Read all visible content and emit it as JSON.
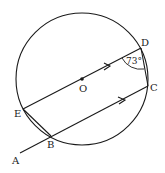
{
  "diagram": {
    "type": "circle-geometry",
    "circle": {
      "center_label": "O",
      "cx": 82,
      "cy": 79,
      "r": 66
    },
    "points": {
      "A": {
        "label": "A",
        "x": 20,
        "y": 153
      },
      "B": {
        "label": "B",
        "x": 51,
        "y": 136
      },
      "C": {
        "label": "C",
        "x": 148,
        "y": 86
      },
      "D": {
        "label": "D",
        "x": 141,
        "y": 48
      },
      "E": {
        "label": "E",
        "x": 23,
        "y": 109
      },
      "O": {
        "label": "O",
        "x": 82,
        "y": 79
      }
    },
    "segments": [
      "ED",
      "AC",
      "EB",
      "DC"
    ],
    "parallel_marks": [
      "ED",
      "BC"
    ],
    "angle": {
      "vertex": "D",
      "label": "73°"
    },
    "stroke_color": "#1a1a1a"
  }
}
